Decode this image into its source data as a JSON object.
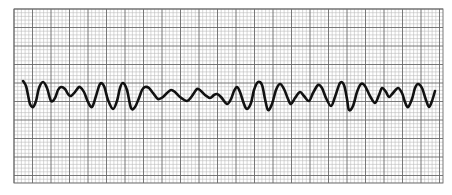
{
  "chart_data": {
    "type": "line",
    "title": "",
    "xlabel": "",
    "ylabel": "",
    "grid": true,
    "legend": null,
    "plot_area": {
      "x0": 14,
      "y0": 9,
      "x1": 443,
      "y1": 183
    },
    "grid_spec": {
      "minor_px": 3.7,
      "major_every": 5,
      "minor_color": "#b8b8b8",
      "major_color": "#6a6a6a",
      "paper_color": "#ffffff"
    },
    "trace_color": "#111111",
    "trace_width": 2.6,
    "series": [
      {
        "name": "ECG trace",
        "points": [
          [
            23,
            81
          ],
          [
            26,
            86
          ],
          [
            28,
            95
          ],
          [
            30,
            104
          ],
          [
            33,
            107
          ],
          [
            36,
            101
          ],
          [
            39,
            88
          ],
          [
            43,
            82
          ],
          [
            47,
            88
          ],
          [
            51,
            101
          ],
          [
            55,
            98
          ],
          [
            58,
            90
          ],
          [
            61,
            87
          ],
          [
            65,
            89
          ],
          [
            68,
            94
          ],
          [
            71,
            96
          ],
          [
            75,
            92
          ],
          [
            78,
            88
          ],
          [
            80,
            87
          ],
          [
            84,
            92
          ],
          [
            88,
            102
          ],
          [
            92,
            107
          ],
          [
            96,
            96
          ],
          [
            100,
            84
          ],
          [
            104,
            86
          ],
          [
            108,
            100
          ],
          [
            113,
            109
          ],
          [
            117,
            101
          ],
          [
            120,
            88
          ],
          [
            123,
            83
          ],
          [
            127,
            90
          ],
          [
            131,
            108
          ],
          [
            135,
            107
          ],
          [
            139,
            98
          ],
          [
            142,
            90
          ],
          [
            145,
            87
          ],
          [
            149,
            88
          ],
          [
            153,
            93
          ],
          [
            158,
            99
          ],
          [
            163,
            97
          ],
          [
            167,
            93
          ],
          [
            171,
            90
          ],
          [
            175,
            92
          ],
          [
            180,
            97
          ],
          [
            187,
            101
          ],
          [
            192,
            96
          ],
          [
            197,
            89
          ],
          [
            201,
            91
          ],
          [
            205,
            95
          ],
          [
            210,
            98
          ],
          [
            214,
            95
          ],
          [
            217,
            94
          ],
          [
            221,
            97
          ],
          [
            227,
            104
          ],
          [
            231,
            99
          ],
          [
            234,
            91
          ],
          [
            237,
            87
          ],
          [
            240,
            92
          ],
          [
            244,
            104
          ],
          [
            247,
            109
          ],
          [
            251,
            103
          ],
          [
            254,
            90
          ],
          [
            258,
            82
          ],
          [
            262,
            85
          ],
          [
            265,
            99
          ],
          [
            268,
            110
          ],
          [
            272,
            104
          ],
          [
            276,
            90
          ],
          [
            280,
            84
          ],
          [
            284,
            89
          ],
          [
            288,
            99
          ],
          [
            291,
            104
          ],
          [
            295,
            98
          ],
          [
            300,
            92
          ],
          [
            304,
            96
          ],
          [
            309,
            101
          ],
          [
            313,
            93
          ],
          [
            318,
            85
          ],
          [
            322,
            88
          ],
          [
            326,
            98
          ],
          [
            331,
            106
          ],
          [
            335,
            97
          ],
          [
            340,
            83
          ],
          [
            344,
            85
          ],
          [
            347,
            99
          ],
          [
            349,
            110
          ],
          [
            353,
            106
          ],
          [
            357,
            92
          ],
          [
            361,
            84
          ],
          [
            365,
            86
          ],
          [
            370,
            96
          ],
          [
            375,
            103
          ],
          [
            379,
            95
          ],
          [
            382,
            88
          ],
          [
            386,
            92
          ],
          [
            389,
            97
          ],
          [
            393,
            93
          ],
          [
            398,
            88
          ],
          [
            402,
            93
          ],
          [
            405,
            102
          ],
          [
            408,
            107
          ],
          [
            412,
            99
          ],
          [
            415,
            88
          ],
          [
            418,
            84
          ],
          [
            422,
            88
          ],
          [
            426,
            100
          ],
          [
            429,
            107
          ],
          [
            432,
            101
          ],
          [
            435,
            91
          ]
        ]
      }
    ]
  }
}
